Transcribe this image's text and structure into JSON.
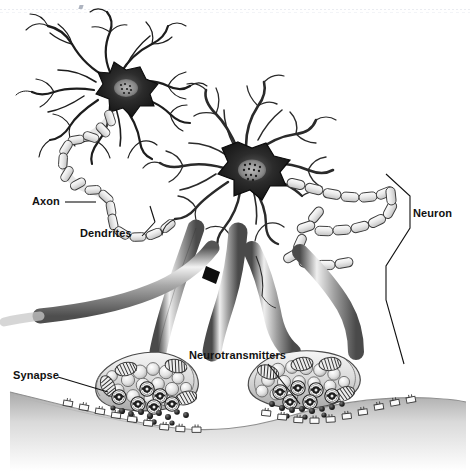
{
  "figure": {
    "background_color": "#ffffff",
    "ink_color": "#111111",
    "style": "grayscale pencil / airbrush scientific illustration",
    "width": 470,
    "height": 471
  },
  "labels": {
    "axon": "Axon",
    "dendrites": "Dendrites",
    "synapse": "Synapse",
    "neurotransmitters": "Neurotransmitters",
    "neuron": "Neuron"
  },
  "leader_lines": {
    "axon": "horizontal rule from label to myelinated axon chain",
    "dendrites": "short angled rule up-right to dendrite arbor",
    "synapse": "angled rule down-right to synaptic terminal bulb",
    "neurotransmitters": "angled rule down-right into synaptic cleft",
    "neuron": "tall vertical bracket spanning the right-hand neuron"
  },
  "structures": [
    {
      "name": "soma-upper",
      "label": "cell body (upper neuron)",
      "note": "dark star-shaped soma with nucleus"
    },
    {
      "name": "soma-lower",
      "label": "cell body (lower neuron)",
      "note": "dark star-shaped soma with speckled nucleus"
    },
    {
      "name": "dendrite-arbor",
      "label": "dendrites",
      "note": "many branching fine processes radiating from soma"
    },
    {
      "name": "myelinated-axon",
      "label": "axon",
      "note": "chain of capsule-shaped myelin segments with nodes of Ranvier"
    },
    {
      "name": "axon-trunk",
      "label": "axon trunk",
      "note": "thick shaded tubes descending to terminals"
    },
    {
      "name": "synaptic-terminal",
      "label": "synaptic terminal bouton",
      "note": "bulb containing vesicles and mitochondria"
    },
    {
      "name": "synaptic-vesicle",
      "label": "synaptic vesicle",
      "note": "pale round sacs inside terminal"
    },
    {
      "name": "mitochondrion",
      "label": "mitochondrion",
      "note": "oval organelle with internal cristae stripes"
    },
    {
      "name": "neurotransmitter-molecule",
      "label": "neurotransmitter",
      "note": "small dark clustered spheres in cleft"
    },
    {
      "name": "receptor",
      "label": "receptor",
      "note": "small open rectangles along postsynaptic membrane"
    },
    {
      "name": "postsynaptic-membrane",
      "label": "postsynaptic membrane",
      "note": "shaded undulating surface at bottom"
    }
  ],
  "palette": {
    "ink": "#111111",
    "mid_gray": "#8d8d8d",
    "light_gray": "#cfcfcf",
    "soma_dark": "#1b1b1b",
    "paper": "#ffffff"
  }
}
